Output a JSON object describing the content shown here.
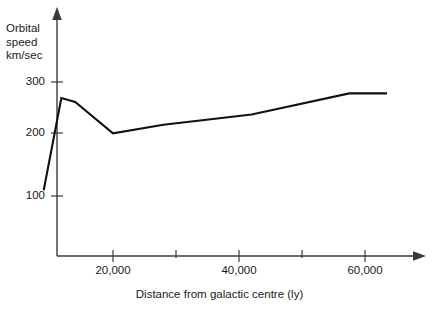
{
  "chart_data": {
    "type": "line",
    "title": "",
    "subtitle": "",
    "xlabel": "Distance from galactic centre (ly)",
    "ylabel_lines": [
      "Orbital",
      "speed",
      "km/sec"
    ],
    "ylabel": "Orbital speed km/sec",
    "grid": false,
    "legend": null,
    "legend_position": "none",
    "xlim": [
      8000,
      68000
    ],
    "ylim": [
      0,
      330
    ],
    "xticks": [
      20000,
      40000,
      60000
    ],
    "xtick_labels": [
      "20,000",
      "40,000",
      "60,000"
    ],
    "x_minor_ticks": [
      30000,
      50000
    ],
    "yticks": [
      100,
      200,
      300
    ],
    "ytick_labels": [
      "100",
      "200",
      "300"
    ],
    "x": [
      9000,
      11800,
      14000,
      20000,
      28000,
      42000,
      57500,
      63500
    ],
    "values": [
      110,
      272,
      265,
      210,
      225,
      243,
      280,
      280
    ],
    "series": [
      {
        "name": "galactic rotation curve",
        "x": [
          9000,
          11800,
          14000,
          20000,
          28000,
          42000,
          57500,
          63500
        ],
        "values": [
          110,
          272,
          265,
          210,
          225,
          243,
          280,
          280
        ]
      }
    ],
    "annotations": [],
    "colors": {
      "curve": "#121212",
      "axis": "#3b3b3b",
      "background": "#ffffff",
      "text": "#1a1a1a"
    }
  }
}
